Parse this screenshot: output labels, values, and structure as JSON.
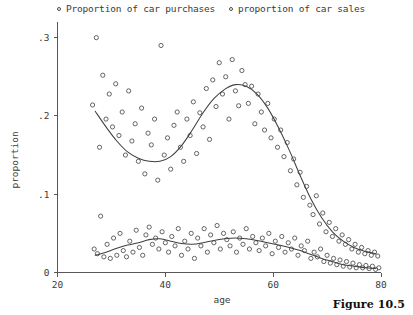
{
  "figure": {
    "caption": "Figure 10.5"
  },
  "legend": {
    "position": "top",
    "entries": [
      {
        "marker": "open-circle",
        "label": "Proportion of car purchases"
      },
      {
        "marker": "open-circle",
        "label": "proportion of car sales"
      }
    ]
  },
  "chart_data": {
    "type": "scatter",
    "title": "",
    "subtitle": "",
    "xlabel": "age",
    "ylabel": "proportion",
    "xlim": [
      20,
      80
    ],
    "ylim": [
      0,
      0.32
    ],
    "xticks": [
      20,
      40,
      60,
      80
    ],
    "xticklabels": [
      "20",
      "40",
      "60",
      "80"
    ],
    "yticks": [
      0,
      0.1,
      0.2,
      0.3
    ],
    "yticklabels": [
      "0",
      ".1",
      ".2",
      ".3"
    ],
    "grid": false,
    "legend_position": "top",
    "marker_style": "open-circle",
    "series": [
      {
        "name": "Proportion of car purchases",
        "marker": "open-circle",
        "points": [
          [
            26.5,
            0.214
          ],
          [
            27.2,
            0.3
          ],
          [
            27.8,
            0.16
          ],
          [
            28.4,
            0.252
          ],
          [
            29.0,
            0.196
          ],
          [
            29.6,
            0.228
          ],
          [
            30.2,
            0.186
          ],
          [
            30.8,
            0.241
          ],
          [
            31.4,
            0.175
          ],
          [
            32.0,
            0.205
          ],
          [
            32.6,
            0.15
          ],
          [
            33.2,
            0.232
          ],
          [
            33.8,
            0.168
          ],
          [
            34.4,
            0.19
          ],
          [
            35.0,
            0.142
          ],
          [
            35.6,
            0.21
          ],
          [
            36.2,
            0.126
          ],
          [
            36.8,
            0.178
          ],
          [
            37.4,
            0.163
          ],
          [
            38.0,
            0.196
          ],
          [
            38.6,
            0.118
          ],
          [
            39.2,
            0.29
          ],
          [
            39.8,
            0.15
          ],
          [
            40.4,
            0.172
          ],
          [
            41.0,
            0.132
          ],
          [
            41.6,
            0.188
          ],
          [
            42.2,
            0.205
          ],
          [
            42.8,
            0.16
          ],
          [
            43.4,
            0.142
          ],
          [
            44.0,
            0.196
          ],
          [
            44.6,
            0.175
          ],
          [
            45.2,
            0.218
          ],
          [
            45.8,
            0.152
          ],
          [
            46.4,
            0.204
          ],
          [
            47.0,
            0.186
          ],
          [
            47.6,
            0.235
          ],
          [
            48.2,
            0.17
          ],
          [
            48.8,
            0.246
          ],
          [
            49.4,
            0.212
          ],
          [
            50.0,
            0.268
          ],
          [
            50.6,
            0.228
          ],
          [
            51.2,
            0.25
          ],
          [
            51.8,
            0.196
          ],
          [
            52.4,
            0.272
          ],
          [
            53.0,
            0.232
          ],
          [
            53.6,
            0.213
          ],
          [
            54.2,
            0.258
          ],
          [
            54.8,
            0.24
          ],
          [
            55.4,
            0.216
          ],
          [
            56.0,
            0.238
          ],
          [
            56.6,
            0.19
          ],
          [
            57.2,
            0.228
          ],
          [
            57.8,
            0.205
          ],
          [
            58.4,
            0.182
          ],
          [
            59.0,
            0.216
          ],
          [
            59.6,
            0.172
          ],
          [
            60.2,
            0.196
          ],
          [
            60.8,
            0.16
          ],
          [
            61.4,
            0.182
          ],
          [
            62.0,
            0.148
          ],
          [
            62.6,
            0.166
          ],
          [
            63.2,
            0.13
          ],
          [
            63.8,
            0.145
          ],
          [
            64.4,
            0.112
          ],
          [
            65.0,
            0.128
          ],
          [
            65.6,
            0.096
          ],
          [
            66.2,
            0.11
          ],
          [
            66.8,
            0.086
          ],
          [
            67.4,
            0.074
          ],
          [
            68.0,
            0.098
          ],
          [
            68.6,
            0.062
          ],
          [
            69.2,
            0.076
          ],
          [
            69.8,
            0.052
          ],
          [
            70.4,
            0.064
          ],
          [
            71.0,
            0.046
          ],
          [
            71.6,
            0.056
          ],
          [
            72.2,
            0.04
          ],
          [
            72.8,
            0.048
          ],
          [
            73.4,
            0.036
          ],
          [
            74.0,
            0.042
          ],
          [
            74.6,
            0.03
          ],
          [
            75.2,
            0.036
          ],
          [
            75.8,
            0.026
          ],
          [
            76.4,
            0.032
          ],
          [
            77.0,
            0.024
          ],
          [
            77.6,
            0.028
          ],
          [
            78.2,
            0.022
          ],
          [
            78.8,
            0.026
          ],
          [
            79.4,
            0.021
          ]
        ],
        "smooth": [
          [
            27.0,
            0.206
          ],
          [
            29.0,
            0.186
          ],
          [
            31.0,
            0.168
          ],
          [
            33.0,
            0.154
          ],
          [
            35.0,
            0.146
          ],
          [
            37.0,
            0.142
          ],
          [
            39.0,
            0.142
          ],
          [
            41.0,
            0.148
          ],
          [
            43.0,
            0.162
          ],
          [
            45.0,
            0.182
          ],
          [
            47.0,
            0.204
          ],
          [
            49.0,
            0.222
          ],
          [
            51.0,
            0.234
          ],
          [
            53.0,
            0.24
          ],
          [
            55.0,
            0.238
          ],
          [
            57.0,
            0.228
          ],
          [
            59.0,
            0.21
          ],
          [
            61.0,
            0.185
          ],
          [
            63.0,
            0.156
          ],
          [
            65.0,
            0.124
          ],
          [
            67.0,
            0.094
          ],
          [
            69.0,
            0.07
          ],
          [
            71.0,
            0.052
          ],
          [
            73.0,
            0.04
          ],
          [
            75.0,
            0.032
          ],
          [
            77.0,
            0.027
          ],
          [
            79.0,
            0.024
          ]
        ]
      },
      {
        "name": "proportion of car sales",
        "marker": "open-circle",
        "points": [
          [
            26.8,
            0.03
          ],
          [
            27.4,
            0.024
          ],
          [
            28.0,
            0.072
          ],
          [
            28.6,
            0.02
          ],
          [
            29.2,
            0.036
          ],
          [
            29.8,
            0.018
          ],
          [
            30.4,
            0.044
          ],
          [
            31.0,
            0.022
          ],
          [
            31.6,
            0.05
          ],
          [
            32.2,
            0.028
          ],
          [
            32.8,
            0.02
          ],
          [
            33.4,
            0.04
          ],
          [
            34.0,
            0.026
          ],
          [
            34.6,
            0.054
          ],
          [
            35.2,
            0.032
          ],
          [
            35.8,
            0.022
          ],
          [
            36.4,
            0.048
          ],
          [
            37.0,
            0.058
          ],
          [
            37.6,
            0.036
          ],
          [
            38.2,
            0.044
          ],
          [
            38.8,
            0.03
          ],
          [
            39.4,
            0.052
          ],
          [
            40.0,
            0.038
          ],
          [
            40.6,
            0.026
          ],
          [
            41.2,
            0.046
          ],
          [
            41.8,
            0.034
          ],
          [
            42.4,
            0.056
          ],
          [
            43.0,
            0.022
          ],
          [
            43.6,
            0.04
          ],
          [
            44.2,
            0.03
          ],
          [
            44.8,
            0.05
          ],
          [
            45.4,
            0.018
          ],
          [
            46.0,
            0.044
          ],
          [
            46.6,
            0.034
          ],
          [
            47.2,
            0.056
          ],
          [
            47.8,
            0.026
          ],
          [
            48.4,
            0.048
          ],
          [
            49.0,
            0.038
          ],
          [
            49.6,
            0.06
          ],
          [
            50.2,
            0.03
          ],
          [
            50.8,
            0.05
          ],
          [
            51.4,
            0.042
          ],
          [
            52.0,
            0.034
          ],
          [
            52.6,
            0.052
          ],
          [
            53.2,
            0.026
          ],
          [
            53.8,
            0.044
          ],
          [
            54.4,
            0.036
          ],
          [
            55.0,
            0.056
          ],
          [
            55.6,
            0.03
          ],
          [
            56.2,
            0.046
          ],
          [
            56.8,
            0.038
          ],
          [
            57.4,
            0.028
          ],
          [
            58.0,
            0.044
          ],
          [
            58.6,
            0.034
          ],
          [
            59.2,
            0.05
          ],
          [
            59.8,
            0.024
          ],
          [
            60.4,
            0.04
          ],
          [
            61.0,
            0.032
          ],
          [
            61.6,
            0.046
          ],
          [
            62.2,
            0.026
          ],
          [
            62.8,
            0.038
          ],
          [
            63.4,
            0.03
          ],
          [
            64.0,
            0.044
          ],
          [
            64.6,
            0.022
          ],
          [
            65.2,
            0.034
          ],
          [
            65.8,
            0.028
          ],
          [
            66.4,
            0.04
          ],
          [
            67.0,
            0.018
          ],
          [
            67.6,
            0.026
          ],
          [
            68.2,
            0.02
          ],
          [
            68.8,
            0.03
          ],
          [
            69.4,
            0.014
          ],
          [
            70.0,
            0.022
          ],
          [
            70.6,
            0.012
          ],
          [
            71.2,
            0.018
          ],
          [
            71.8,
            0.01
          ],
          [
            72.4,
            0.016
          ],
          [
            73.0,
            0.008
          ],
          [
            73.6,
            0.014
          ],
          [
            74.2,
            0.007
          ],
          [
            74.8,
            0.012
          ],
          [
            75.4,
            0.006
          ],
          [
            76.0,
            0.01
          ],
          [
            76.6,
            0.006
          ],
          [
            77.2,
            0.009
          ],
          [
            77.8,
            0.005
          ],
          [
            78.4,
            0.008
          ],
          [
            79.0,
            0.004
          ],
          [
            79.6,
            0.006
          ]
        ],
        "smooth": [
          [
            27.0,
            0.022
          ],
          [
            29.0,
            0.026
          ],
          [
            31.0,
            0.031
          ],
          [
            33.0,
            0.035
          ],
          [
            35.0,
            0.038
          ],
          [
            37.0,
            0.042
          ],
          [
            39.0,
            0.043
          ],
          [
            41.0,
            0.04
          ],
          [
            43.0,
            0.037
          ],
          [
            45.0,
            0.036
          ],
          [
            47.0,
            0.038
          ],
          [
            49.0,
            0.041
          ],
          [
            51.0,
            0.043
          ],
          [
            53.0,
            0.044
          ],
          [
            55.0,
            0.043
          ],
          [
            57.0,
            0.041
          ],
          [
            59.0,
            0.038
          ],
          [
            61.0,
            0.035
          ],
          [
            63.0,
            0.032
          ],
          [
            65.0,
            0.028
          ],
          [
            67.0,
            0.023
          ],
          [
            69.0,
            0.018
          ],
          [
            71.0,
            0.014
          ],
          [
            73.0,
            0.01
          ],
          [
            75.0,
            0.008
          ],
          [
            77.0,
            0.006
          ],
          [
            79.0,
            0.005
          ]
        ]
      }
    ]
  }
}
